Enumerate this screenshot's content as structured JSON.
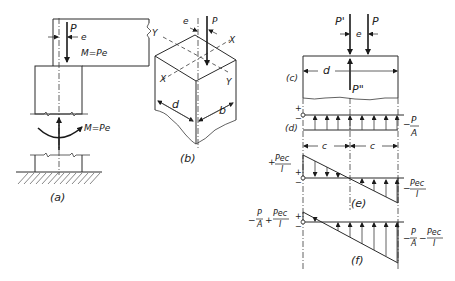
{
  "figure": {
    "panels": [
      {
        "id": "a",
        "caption": "(a)",
        "labels": {
          "force": "P",
          "eccentricity": "e",
          "moment_top": "M=Pe",
          "moment_bottom": "M=Pe"
        }
      },
      {
        "id": "b",
        "caption": "(b)",
        "labels": {
          "eccentricity": "e",
          "force": "P",
          "axis_x1": "X",
          "axis_x2": "X",
          "axis_y1": "Y",
          "axis_y2": "Y",
          "depth": "d",
          "width": "b"
        }
      },
      {
        "id": "c",
        "caption": "(c)",
        "labels": {
          "force_p_prime": "P'",
          "force_p": "P",
          "eccentricity": "e",
          "depth": "d",
          "force_p_double": "P\""
        }
      },
      {
        "id": "d",
        "caption": "(d)",
        "labels": {
          "plus": "+",
          "minus": "−",
          "stress": "−P/A",
          "stress_num": "P",
          "stress_den": "A"
        }
      },
      {
        "id": "e",
        "caption": "(e)",
        "labels": {
          "c_left": "c",
          "c_right": "c",
          "plus": "+",
          "minus": "−",
          "top_stress_num": "Pec",
          "top_stress_den": "I",
          "bottom_stress_num": "Pec",
          "bottom_stress_den": "I"
        }
      },
      {
        "id": "f",
        "caption": "(f)",
        "labels": {
          "plus": "+",
          "minus": "−",
          "left_term1_num": "P",
          "left_term1_den": "A",
          "left_term2_num": "Pec",
          "left_term2_den": "I",
          "right_term1_num": "P",
          "right_term1_den": "A",
          "right_term2_num": "Pec",
          "right_term2_den": "I"
        }
      }
    ]
  }
}
